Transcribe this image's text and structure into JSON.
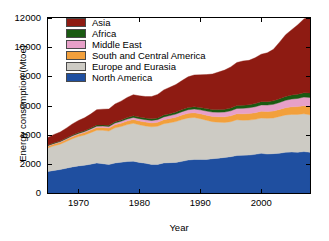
{
  "chart_data": {
    "type": "area",
    "title": "",
    "xlabel": "Year",
    "ylabel": "Energy consumption (Mtoe)",
    "xlim": [
      1965,
      2008
    ],
    "ylim": [
      0,
      12000
    ],
    "xticks": [
      1970,
      1980,
      1990,
      2000
    ],
    "yticks": [
      0,
      2000,
      4000,
      6000,
      8000,
      10000,
      12000
    ],
    "grid": false,
    "stacked": true,
    "legend_position": "top-left-inside",
    "x": [
      1965,
      1966,
      1967,
      1968,
      1969,
      1970,
      1971,
      1972,
      1973,
      1974,
      1975,
      1976,
      1977,
      1978,
      1979,
      1980,
      1981,
      1982,
      1983,
      1984,
      1985,
      1986,
      1987,
      1988,
      1989,
      1990,
      1991,
      1992,
      1993,
      1994,
      1995,
      1996,
      1997,
      1998,
      1999,
      2000,
      2001,
      2002,
      2003,
      2004,
      2005,
      2006,
      2007,
      2008
    ],
    "series": [
      {
        "name": "North America",
        "color": "#1F4FA0",
        "values": [
          1480,
          1550,
          1610,
          1700,
          1790,
          1860,
          1900,
          1980,
          2060,
          2010,
          1950,
          2060,
          2110,
          2160,
          2180,
          2100,
          2040,
          1960,
          1960,
          2060,
          2080,
          2100,
          2170,
          2260,
          2300,
          2300,
          2300,
          2350,
          2390,
          2440,
          2490,
          2570,
          2590,
          2600,
          2650,
          2720,
          2670,
          2700,
          2730,
          2790,
          2810,
          2790,
          2840,
          2790
        ]
      },
      {
        "name": "Europe and Eurasia",
        "color": "#CDCBC4",
        "values": [
          1620,
          1690,
          1740,
          1830,
          1930,
          2010,
          2080,
          2160,
          2250,
          2290,
          2300,
          2410,
          2450,
          2530,
          2600,
          2580,
          2560,
          2580,
          2620,
          2690,
          2740,
          2800,
          2870,
          2890,
          2880,
          2800,
          2690,
          2540,
          2470,
          2400,
          2400,
          2450,
          2400,
          2400,
          2400,
          2420,
          2450,
          2450,
          2520,
          2560,
          2580,
          2600,
          2590,
          2570
        ]
      },
      {
        "name": "South and Central America",
        "color": "#F2A03C",
        "values": [
          110,
          118,
          125,
          133,
          142,
          152,
          162,
          173,
          186,
          196,
          204,
          218,
          230,
          243,
          255,
          260,
          262,
          265,
          268,
          278,
          285,
          297,
          308,
          318,
          325,
          333,
          345,
          357,
          369,
          384,
          400,
          418,
          437,
          448,
          455,
          470,
          468,
          472,
          480,
          500,
          518,
          536,
          556,
          572
        ]
      },
      {
        "name": "Middle East",
        "color": "#E7A0C8",
        "values": [
          40,
          44,
          48,
          53,
          59,
          65,
          72,
          80,
          89,
          96,
          105,
          117,
          128,
          140,
          150,
          155,
          162,
          170,
          180,
          192,
          204,
          216,
          228,
          240,
          252,
          268,
          285,
          300,
          315,
          330,
          345,
          360,
          378,
          395,
          410,
          428,
          442,
          458,
          480,
          508,
          535,
          560,
          590,
          620
        ]
      },
      {
        "name": "Africa",
        "color": "#1A5A12",
        "values": [
          40,
          43,
          46,
          49,
          53,
          57,
          61,
          66,
          71,
          75,
          80,
          86,
          92,
          98,
          104,
          108,
          112,
          116,
          121,
          126,
          132,
          138,
          144,
          150,
          156,
          162,
          168,
          174,
          180,
          186,
          192,
          199,
          206,
          212,
          219,
          227,
          234,
          242,
          252,
          266,
          278,
          288,
          300,
          312
        ]
      },
      {
        "name": "Asia",
        "color": "#8E1B12",
        "values": [
          520,
          570,
          610,
          680,
          760,
          830,
          880,
          950,
          1060,
          1080,
          1120,
          1210,
          1290,
          1380,
          1450,
          1460,
          1480,
          1520,
          1610,
          1720,
          1810,
          1890,
          1990,
          2110,
          2180,
          2240,
          2330,
          2440,
          2570,
          2690,
          2820,
          2950,
          3040,
          3040,
          3140,
          3250,
          3350,
          3530,
          3880,
          4230,
          4480,
          4760,
          5060,
          5230
        ]
      }
    ],
    "totals_note": "Stacked totals rise from about 3810 Mtoe in 1965 to about 11100 Mtoe in 2008"
  },
  "legend": {
    "entries": [
      {
        "label": "Asia",
        "color": "#8E1B12"
      },
      {
        "label": "Africa",
        "color": "#1A5A12"
      },
      {
        "label": "Middle East",
        "color": "#E7A0C8"
      },
      {
        "label": "South and Central America",
        "color": "#F2A03C"
      },
      {
        "label": "Europe and Eurasia",
        "color": "#CDCBC4"
      },
      {
        "label": "North America",
        "color": "#1F4FA0"
      }
    ]
  },
  "axes": {
    "y_tick_labels": [
      "0",
      "2000",
      "4000",
      "6000",
      "8000",
      "10000",
      "12000"
    ],
    "x_tick_labels": [
      "1970",
      "1980",
      "1990",
      "2000"
    ],
    "y_title": "Energy consumption (Mtoe)",
    "x_title": "Year"
  }
}
